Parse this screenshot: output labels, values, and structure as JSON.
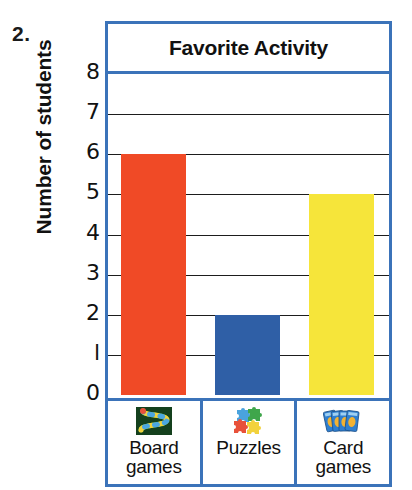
{
  "worksheet": {
    "question_number": "2."
  },
  "chart_data": {
    "type": "bar",
    "title": "Favorite Activity",
    "xlabel": "",
    "ylabel": "Number of students",
    "categories": [
      "Board games",
      "Puzzles",
      "Card games"
    ],
    "values": [
      6,
      2,
      5
    ],
    "ylim": [
      0,
      8
    ],
    "ytick_labels": [
      "8",
      "7",
      "6",
      "5",
      "4",
      "3",
      "2",
      "l",
      "0"
    ],
    "ytick_values": [
      8,
      7,
      6,
      5,
      4,
      3,
      2,
      1,
      0
    ],
    "grid": true,
    "legend": "none",
    "bar_colors": [
      "#F04A26",
      "#2F5FA6",
      "#F6E53A"
    ],
    "frame_color": "#3b73b9",
    "gridline_color": "#1d1d1d"
  },
  "categories_detail": [
    {
      "label_line1": "Board",
      "label_line2": "games",
      "icon": "board-game-icon",
      "value": 6,
      "color": "#F04A26"
    },
    {
      "label_line1": "Puzzles",
      "label_line2": "",
      "icon": "puzzle-pieces-icon",
      "value": 2,
      "color": "#2F5FA6"
    },
    {
      "label_line1": "Card",
      "label_line2": "games",
      "icon": "playing-cards-icon",
      "value": 5,
      "color": "#F6E53A"
    }
  ]
}
